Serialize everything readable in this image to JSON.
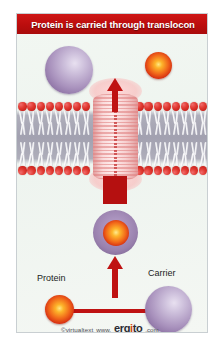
{
  "figure": {
    "title": "Protein is carried through translocon",
    "background_color": "#ffffff",
    "panel_background": "#eef4ef",
    "title_bar_color": "#bb0d0d"
  },
  "labels": {
    "protein": "Protein",
    "carrier": "Carrier"
  },
  "watermark": {
    "copyright": "©virtualtext",
    "www": "www.",
    "brand_pre": "erg",
    "brand_o": "i",
    "brand_post": "to",
    "tld": ".com",
    "brand_full": "ergito"
  },
  "diagram": {
    "type": "biology-membrane-transport",
    "membrane": {
      "name": "lipid bilayer",
      "head_color": "#e13a32",
      "tail_color": "#ffffff",
      "core_color": "#8f8ca0",
      "leaflets": 2,
      "lipids_per_leaflet_left": 8,
      "lipids_per_leaflet_right": 8
    },
    "translocon": {
      "name": "translocon channel",
      "color": "#f7cdcd",
      "ridge_color": "#e28888"
    },
    "particles": [
      {
        "name": "carrier-top",
        "kind": "carrier",
        "color": "#a992bd",
        "position": "above membrane"
      },
      {
        "name": "protein-top",
        "kind": "protein",
        "color": "#f1681a",
        "position": "above membrane, released"
      },
      {
        "name": "carrier-protein-complex",
        "kind": "complex",
        "host_color": "#9a81ae",
        "cargo_color": "#f2691a",
        "position": "below membrane, entering channel"
      },
      {
        "name": "protein-pool",
        "kind": "protein",
        "color": "#f1681a",
        "position": "cytosolic pool, left"
      },
      {
        "name": "carrier-pool",
        "kind": "carrier",
        "color": "#a992bd",
        "position": "cytosolic pool, right"
      }
    ],
    "arrows": [
      {
        "name": "arrow-exit",
        "direction": "up",
        "color": "#bf1212"
      },
      {
        "name": "arrow-transit",
        "direction": "up",
        "color": "#b51010"
      },
      {
        "name": "arrow-load",
        "direction": "up",
        "color": "#bf1212"
      }
    ]
  }
}
